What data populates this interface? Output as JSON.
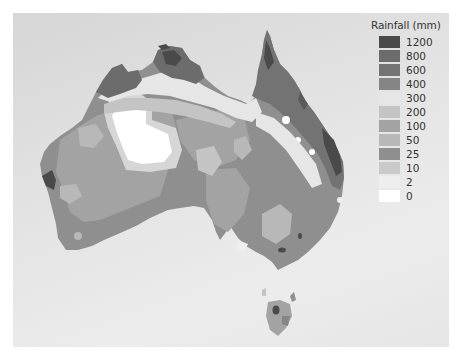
{
  "legend": {
    "title": "Rainfall (mm)",
    "items": [
      {
        "label": "1200",
        "color": "#4a4a4a"
      },
      {
        "label": "800",
        "color": "#6c6c6c"
      },
      {
        "label": "600",
        "color": "#737373"
      },
      {
        "label": "400",
        "color": "#858585"
      },
      {
        "label": "300",
        "color": "#e6e6e6"
      },
      {
        "label": "200",
        "color": "#c4c4c4"
      },
      {
        "label": "100",
        "color": "#a3a3a3"
      },
      {
        "label": "50",
        "color": "#b8b8b8"
      },
      {
        "label": "25",
        "color": "#8f8f8f"
      },
      {
        "label": "10",
        "color": "#c9c9c9"
      },
      {
        "label": "2",
        "color": "#eeeeee"
      },
      {
        "label": "0",
        "color": "#ffffff"
      }
    ]
  },
  "map": {
    "region": "Australia",
    "background_color": "#e2e2e2"
  }
}
